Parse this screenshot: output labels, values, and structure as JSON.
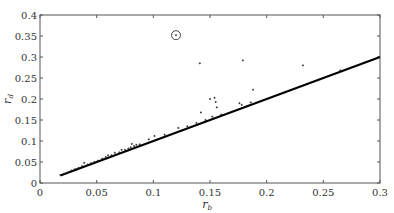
{
  "chart_data": {
    "type": "scatter",
    "title": "",
    "xlabel": "r",
    "xlabel_sub": "b",
    "ylabel": "r",
    "ylabel_sub": "d",
    "xlim": [
      0,
      0.3
    ],
    "ylim": [
      0,
      0.4
    ],
    "grid": false,
    "legend": null,
    "x_ticks": [
      0,
      0.05,
      0.1,
      0.15,
      0.2,
      0.25,
      0.3
    ],
    "x_tick_labels": [
      "0",
      "0.05",
      "0.1",
      "0.15",
      "0.2",
      "0.25",
      "0.3"
    ],
    "y_ticks": [
      0,
      0.05,
      0.1,
      0.15,
      0.2,
      0.25,
      0.3,
      0.35,
      0.4
    ],
    "y_tick_labels": [
      "0",
      "0.05",
      "0.1",
      "0.15",
      "0.2",
      "0.25",
      "0.3",
      "0.35",
      "0.4"
    ],
    "series": [
      {
        "name": "points",
        "kind": "scatter",
        "color": "#222222",
        "points": [
          [
            0.018,
            0.019
          ],
          [
            0.021,
            0.022
          ],
          [
            0.024,
            0.025
          ],
          [
            0.028,
            0.03
          ],
          [
            0.031,
            0.033
          ],
          [
            0.034,
            0.036
          ],
          [
            0.037,
            0.04
          ],
          [
            0.039,
            0.048
          ],
          [
            0.042,
            0.044
          ],
          [
            0.045,
            0.047
          ],
          [
            0.048,
            0.05
          ],
          [
            0.051,
            0.053
          ],
          [
            0.055,
            0.058
          ],
          [
            0.058,
            0.062
          ],
          [
            0.06,
            0.066
          ],
          [
            0.063,
            0.066
          ],
          [
            0.066,
            0.072
          ],
          [
            0.07,
            0.073
          ],
          [
            0.072,
            0.079
          ],
          [
            0.075,
            0.079
          ],
          [
            0.078,
            0.082
          ],
          [
            0.08,
            0.085
          ],
          [
            0.081,
            0.093
          ],
          [
            0.083,
            0.088
          ],
          [
            0.085,
            0.091
          ],
          [
            0.088,
            0.092
          ],
          [
            0.096,
            0.104
          ],
          [
            0.101,
            0.112
          ],
          [
            0.11,
            0.115
          ],
          [
            0.122,
            0.131
          ],
          [
            0.13,
            0.135
          ],
          [
            0.138,
            0.143
          ],
          [
            0.141,
            0.285
          ],
          [
            0.142,
            0.168
          ],
          [
            0.146,
            0.15
          ],
          [
            0.15,
            0.2
          ],
          [
            0.152,
            0.158
          ],
          [
            0.154,
            0.203
          ],
          [
            0.155,
            0.193
          ],
          [
            0.156,
            0.18
          ],
          [
            0.16,
            0.163
          ],
          [
            0.176,
            0.19
          ],
          [
            0.178,
            0.186
          ],
          [
            0.179,
            0.292
          ],
          [
            0.186,
            0.192
          ],
          [
            0.188,
            0.222
          ],
          [
            0.232,
            0.28
          ],
          [
            0.265,
            0.268
          ]
        ]
      },
      {
        "name": "highlighted outlier",
        "kind": "circled-point",
        "points": [
          [
            0.12,
            0.352
          ]
        ]
      },
      {
        "name": "r_d = r_b",
        "kind": "line",
        "color": "#000000",
        "points": [
          [
            0.018,
            0.018
          ],
          [
            0.3,
            0.3
          ]
        ]
      }
    ]
  }
}
